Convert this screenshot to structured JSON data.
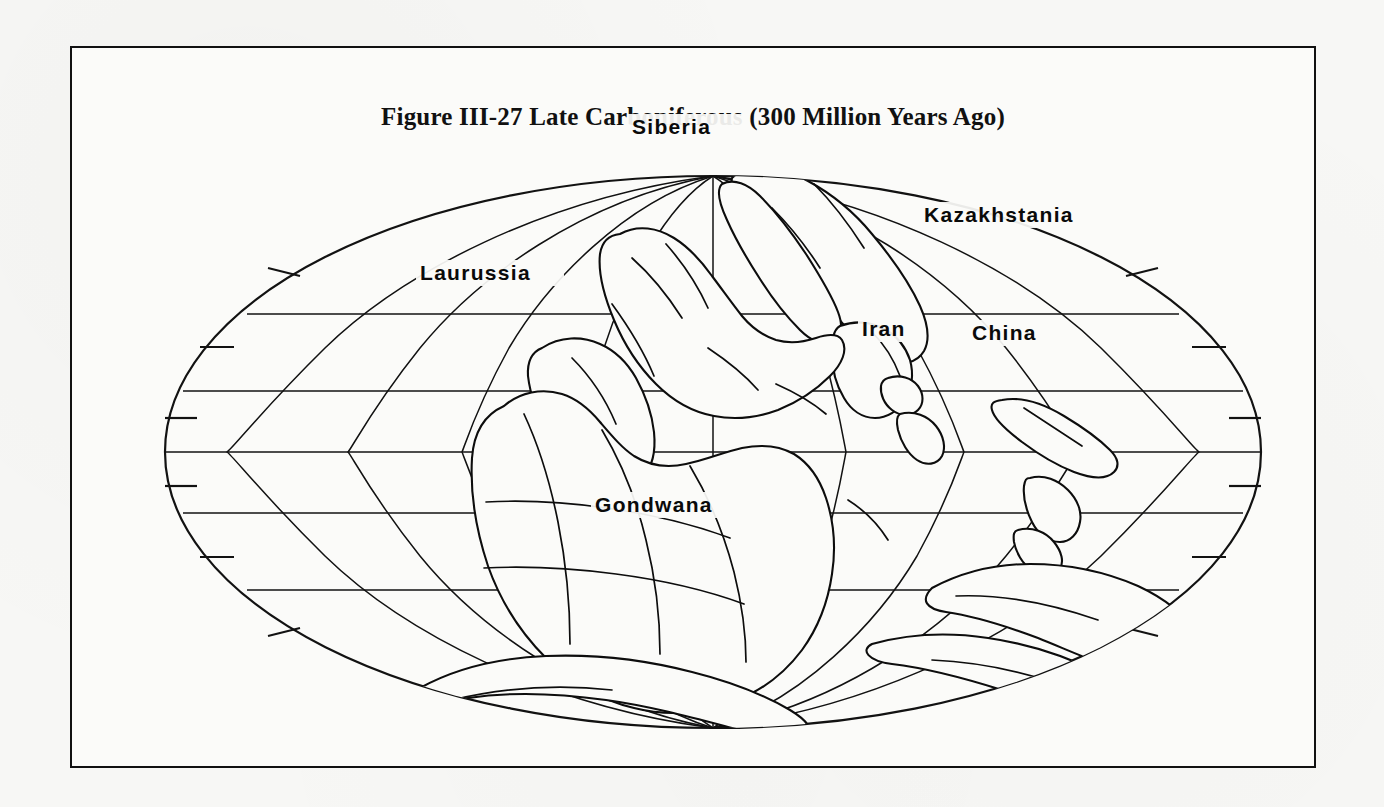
{
  "figure": {
    "caption": "Figure III-27  Late Carboniferous (300 Million Years Ago)",
    "number": "Figure III-27",
    "period": "Late Carboniferous",
    "age": "300 Million Years Ago"
  },
  "map": {
    "projection": "mollweide-elliptical",
    "center_x": 641,
    "center_y": 404,
    "radius_x": 548,
    "radius_y": 276,
    "graticule": {
      "latitude_lines": [
        60,
        30,
        0,
        -30,
        -60
      ],
      "meridian_count": 9,
      "meridian_spacing_deg": 30,
      "tick_latitudes": [
        75,
        45,
        15,
        -15,
        -45,
        -75
      ],
      "grid_on": true
    },
    "labels": [
      {
        "name": "siberia",
        "text": "Siberia",
        "x": 560,
        "y": 86
      },
      {
        "name": "kazakhstania",
        "text": "Kazakhstania",
        "x": 852,
        "y": 174
      },
      {
        "name": "laurussia",
        "text": "Laurussia",
        "x": 348,
        "y": 232
      },
      {
        "name": "iran",
        "text": "Iran",
        "x": 790,
        "y": 288
      },
      {
        "name": "china",
        "text": "China",
        "x": 900,
        "y": 292
      },
      {
        "name": "gondwana",
        "text": "Gondwana",
        "x": 523,
        "y": 464
      }
    ],
    "landmasses": [
      "Laurussia",
      "Gondwana",
      "Siberia",
      "Kazakhstania",
      "China",
      "Iran"
    ],
    "shading": {
      "gondwana_pattern": "cross-stipple",
      "laurasia_pattern": "dash-stipple",
      "ink_color": "#0d0d0d",
      "paper_color": "#fbfbf9"
    }
  },
  "colors": {
    "page_background": "#f7f7f5",
    "frame_border": "#111111",
    "ink": "#0d0d0d"
  }
}
